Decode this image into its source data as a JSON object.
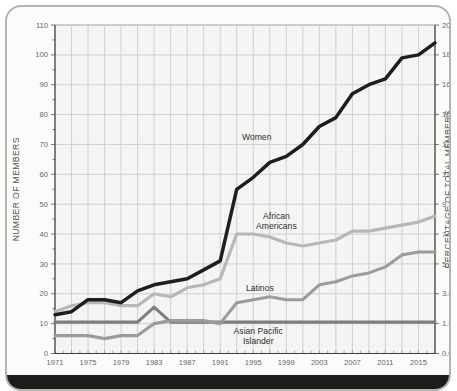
{
  "frame": {
    "card_bg": "#fbfbfa",
    "card_border": "#b3b3af",
    "plot_bg": "#f4f4f2",
    "grid_color": "#cccccc",
    "axis_color": "#3c3c3c",
    "tick_label_color": "#666666",
    "axis_label_color": "#555555",
    "footer_color": "#1d1d1d"
  },
  "chart_data": {
    "type": "line",
    "title": "",
    "xlabel": "",
    "ylabel_left": "NUMBER OF MEMBERS",
    "ylabel_right": "PERCENTAGE OF TOTAL MEMBERS",
    "xlim": [
      1971,
      2017
    ],
    "ylim": [
      0,
      110
    ],
    "grid": true,
    "legend_position": "inline-labels",
    "x": [
      1971,
      1973,
      1975,
      1977,
      1979,
      1981,
      1983,
      1985,
      1987,
      1989,
      1991,
      1993,
      1995,
      1997,
      1999,
      2001,
      2003,
      2005,
      2007,
      2009,
      2011,
      2013,
      2015,
      2017
    ],
    "xtick_labels": [
      "1971",
      "1975",
      "1979",
      "1983",
      "1987",
      "1991",
      "1995",
      "1999",
      "2003",
      "2007",
      "2011",
      "2015"
    ],
    "xtick_years": [
      1971,
      1975,
      1979,
      1983,
      1987,
      1991,
      1995,
      1999,
      2003,
      2007,
      2011,
      2015
    ],
    "yticks_left": [
      0,
      10,
      20,
      30,
      40,
      50,
      60,
      70,
      80,
      90,
      100,
      110
    ],
    "yticks_right_labels": [
      "0.0",
      "1.9",
      "3.8",
      "5.6",
      "7.5",
      "9.3",
      "11.2",
      "13.1",
      "15.0",
      "16.8",
      "18.7",
      "20.6"
    ],
    "series": [
      {
        "name": "Asian Pacific Islander",
        "color": "#7e7e7e",
        "width": 3.1,
        "values": [
          10.5,
          10.5,
          10.5,
          10.5,
          10.5,
          10.5,
          15.5,
          10.5,
          10.5,
          10.5,
          10.5,
          10.5,
          10.5,
          10.5,
          10.5,
          10.5,
          10.5,
          10.5,
          10.5,
          10.5,
          10.5,
          10.5,
          10.5,
          10.5
        ],
        "label": {
          "lines": [
            "Asian Pacific",
            "Islander"
          ],
          "year": 1995.6,
          "value": 6.6,
          "anchor": "middle"
        }
      },
      {
        "name": "Latinos",
        "color": "#9b9b9b",
        "width": 3.1,
        "values": [
          6,
          6,
          6,
          5,
          6,
          6,
          10,
          11,
          11,
          11,
          10,
          17,
          18,
          19,
          18,
          18,
          23,
          24,
          26,
          27,
          29,
          33,
          34,
          34
        ],
        "label": {
          "lines": [
            "Latinos"
          ],
          "year": 1995.8,
          "value": 21.0,
          "anchor": "middle"
        }
      },
      {
        "name": "African Americans",
        "color": "#b7b7b7",
        "width": 3.2,
        "values": [
          14,
          16,
          17,
          17,
          16,
          16,
          20,
          19,
          22,
          23,
          25,
          40,
          40,
          39,
          37,
          36,
          37,
          38,
          41,
          41,
          42,
          43,
          44,
          46
        ],
        "label": {
          "lines": [
            "African",
            "Americans"
          ],
          "year": 1997.8,
          "value": 45.0,
          "anchor": "middle"
        }
      },
      {
        "name": "Women",
        "color": "#1e1e1e",
        "width": 3.5,
        "values": [
          13,
          14,
          18,
          18,
          17,
          21,
          23,
          24,
          25,
          28,
          31,
          55,
          59,
          64,
          66,
          70,
          76,
          79,
          87,
          90,
          92,
          99,
          100,
          104
        ],
        "label": {
          "lines": [
            "Women"
          ],
          "year": 1997.2,
          "value": 71.5,
          "anchor": "end"
        }
      }
    ]
  }
}
